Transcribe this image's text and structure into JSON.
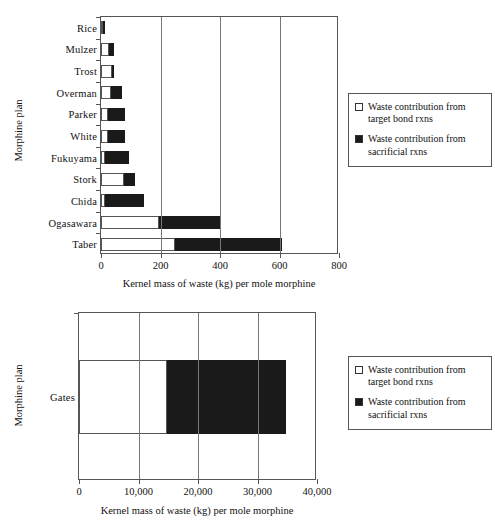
{
  "chart_data": [
    {
      "id": "top",
      "type": "bar",
      "orientation": "horizontal",
      "stacked": true,
      "title": "",
      "xlabel": "Kernel mass of waste (kg) per mole morphine",
      "ylabel": "Morphine plan",
      "xlim": [
        0,
        800
      ],
      "xticks": [
        0,
        200,
        400,
        600,
        800
      ],
      "xtick_labels": [
        "0",
        "200",
        "400",
        "600",
        "800"
      ],
      "grid": true,
      "grid_axis": "x",
      "legend_position": "right",
      "categories": [
        "Rice",
        "Mulzer",
        "Trost",
        "Overman",
        "Parker",
        "White",
        "Fukuyama",
        "Stork",
        "Chida",
        "Ogasawara",
        "Taber"
      ],
      "series": [
        {
          "name": "Waste contribution from target bond rxns",
          "color": "#ffffff",
          "values": [
            4,
            28,
            36,
            32,
            22,
            22,
            15,
            78,
            15,
            195,
            250
          ]
        },
        {
          "name": "Waste contribution from sacrificial rxns",
          "color": "#1a1a1a",
          "values": [
            1,
            17,
            9,
            38,
            58,
            58,
            80,
            37,
            128,
            205,
            360
          ]
        }
      ],
      "totals": [
        5,
        45,
        45,
        70,
        80,
        80,
        95,
        115,
        143,
        400,
        610
      ]
    },
    {
      "id": "bottom",
      "type": "bar",
      "orientation": "horizontal",
      "stacked": true,
      "title": "",
      "xlabel": "Kernel mass of waste (kg) per mole morphine",
      "ylabel": "Morphine plan",
      "xlim": [
        0,
        40000
      ],
      "xticks": [
        0,
        10000,
        20000,
        30000,
        40000
      ],
      "xtick_labels": [
        "0",
        "10,000",
        "20,000",
        "30,000",
        "40,000"
      ],
      "grid": true,
      "grid_axis": "x",
      "legend_position": "right",
      "categories": [
        "Gates"
      ],
      "series": [
        {
          "name": "Waste contribution from target bond rxns",
          "color": "#ffffff",
          "values": [
            14800
          ]
        },
        {
          "name": "Waste contribution from sacrificial rxns",
          "color": "#1a1a1a",
          "values": [
            20000
          ]
        }
      ],
      "totals": [
        34800
      ]
    }
  ],
  "legend": {
    "items": [
      {
        "swatch": "white-square",
        "label": "Waste contribution from\ntarget bond rxns"
      },
      {
        "swatch": "black-square",
        "label": "Waste contribution from\nsacrificial rxns"
      }
    ]
  }
}
